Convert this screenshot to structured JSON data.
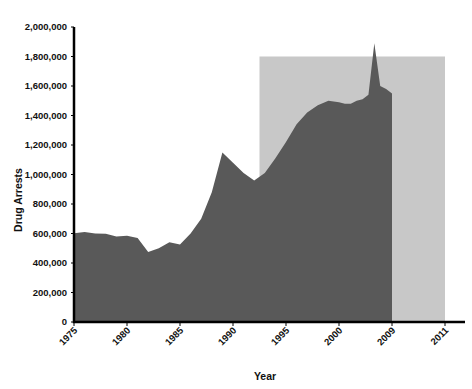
{
  "chart_data": {
    "type": "area",
    "title": "",
    "xlabel": "Year",
    "ylabel": "Drug Arrests",
    "ylim": [
      0,
      2000000
    ],
    "grid": false,
    "legend": "none",
    "series_name": "Drug Arrests",
    "x": [
      1975,
      1976,
      1977,
      1978,
      1979,
      1980,
      1981,
      1982,
      1983,
      1984,
      1985,
      1986,
      1987,
      1988,
      1989,
      1990,
      1991,
      1992,
      1993,
      1994,
      1995,
      1996,
      1997,
      1998,
      1999,
      2000,
      2001,
      2002,
      2003,
      2004,
      2005,
      2006,
      2007,
      2008,
      2009
    ],
    "values": [
      601000,
      610000,
      600000,
      598000,
      580000,
      585000,
      570000,
      475000,
      500000,
      540000,
      525000,
      600000,
      700000,
      880000,
      1150000,
      1080000,
      1010000,
      960000,
      1010000,
      1110000,
      1220000,
      1340000,
      1420000,
      1470000,
      1500000,
      1490000,
      1480000,
      1480000,
      1500000,
      1510000,
      1540000,
      1890000,
      1600000,
      1580000,
      1550000
    ],
    "highlight_band": {
      "label": "shaded reference band",
      "x_start": 1992.5,
      "x_end": 2011,
      "y_top": 1800000,
      "y_bottom": 0,
      "color": "#c8c8c8"
    },
    "area_color": "#595959",
    "axis_color": "#000000",
    "y_ticks": [
      {
        "value": 0,
        "label": "0"
      },
      {
        "value": 200000,
        "label": "200,000"
      },
      {
        "value": 400000,
        "label": "400,000"
      },
      {
        "value": 600000,
        "label": "600,000"
      },
      {
        "value": 800000,
        "label": "800,000"
      },
      {
        "value": 1000000,
        "label": "1,000,000"
      },
      {
        "value": 1200000,
        "label": "1,200,000"
      },
      {
        "value": 1400000,
        "label": "1,400,000"
      },
      {
        "value": 1600000,
        "label": "1,600,000"
      },
      {
        "value": 1800000,
        "label": "1,800,000"
      },
      {
        "value": 2000000,
        "label": "2,000,000"
      }
    ],
    "x_ticks": [
      {
        "value": 1975,
        "label": "1975"
      },
      {
        "value": 1980,
        "label": "1980"
      },
      {
        "value": 1985,
        "label": "1985"
      },
      {
        "value": 1990,
        "label": "1990"
      },
      {
        "value": 1995,
        "label": "1995"
      },
      {
        "value": 2000,
        "label": "2000"
      },
      {
        "value": 2009,
        "label": "2009"
      },
      {
        "value": 2011,
        "label": "2011"
      }
    ]
  }
}
